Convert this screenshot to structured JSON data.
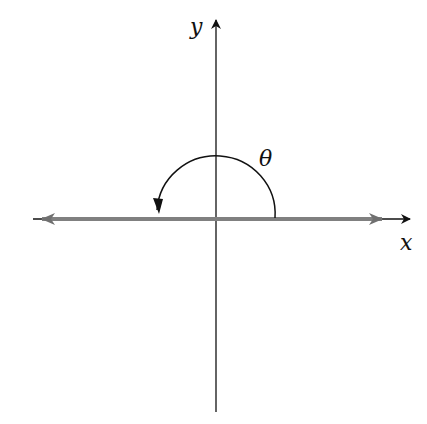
{
  "diagram": {
    "x_axis_label": "x",
    "y_axis_label": "y",
    "angle_label": "θ",
    "ray_color": "#808080",
    "axis_color": "#111111"
  }
}
